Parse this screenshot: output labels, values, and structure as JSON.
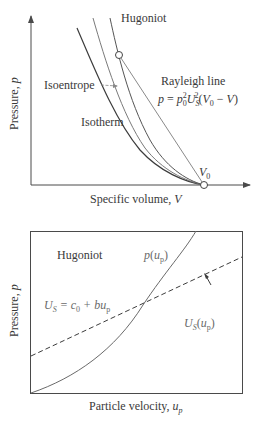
{
  "top_diagram": {
    "hugoniot_label": "Hugoniot",
    "isentrope_label": "Isoentrope",
    "isotherm_label": "Isotherm",
    "rayleigh_label": "Rayleigh line",
    "rayleigh_eq_p": "p",
    "rayleigh_eq_eq": " = ",
    "rayleigh_eq_rho": "p",
    "rayleigh_eq_rho_sub": "0",
    "rayleigh_eq_rho_sup": "2",
    "rayleigh_eq_U": "U",
    "rayleigh_eq_U_sub": "S",
    "rayleigh_eq_U_sup": "2",
    "rayleigh_eq_tail_open": "(",
    "rayleigh_eq_V0": "V",
    "rayleigh_eq_V0_sub": "0",
    "rayleigh_eq_minus": " − ",
    "rayleigh_eq_V": "V",
    "rayleigh_eq_tail_close": ")",
    "v0_label": "V",
    "v0_sub": "0",
    "x_axis_label": "Specific volume, ",
    "x_axis_var": "V",
    "y_axis_label": "Pressure, ",
    "y_axis_var": "p"
  },
  "bottom_diagram": {
    "hugoniot_label": "Hugoniot",
    "p_curve_label": "p",
    "p_curve_arg_open": "(",
    "p_curve_arg": "u",
    "p_curve_arg_sub": "p",
    "p_curve_arg_close": ")",
    "us_eq_U": "U",
    "us_eq_U_sub": "S",
    "us_eq_rest": " = c",
    "us_eq_c_sub": "0",
    "us_eq_tail": " + bu",
    "us_eq_tail_sub": "p",
    "us_curve_U": "U",
    "us_curve_U_sub": "S",
    "us_curve_open": "(",
    "us_curve_u": "u",
    "us_curve_u_sub": "p",
    "us_curve_close": ")",
    "x_axis_label": "Particle velocity, ",
    "x_axis_var": "u",
    "x_axis_var_sub": "p",
    "y_axis_label": "Pressure, ",
    "y_axis_var": "p"
  },
  "colors": {
    "axis": "#4a4a4a",
    "dark_curve": "#3c3c3c",
    "light_curve": "#8a8a8a",
    "background": "#ffffff"
  }
}
